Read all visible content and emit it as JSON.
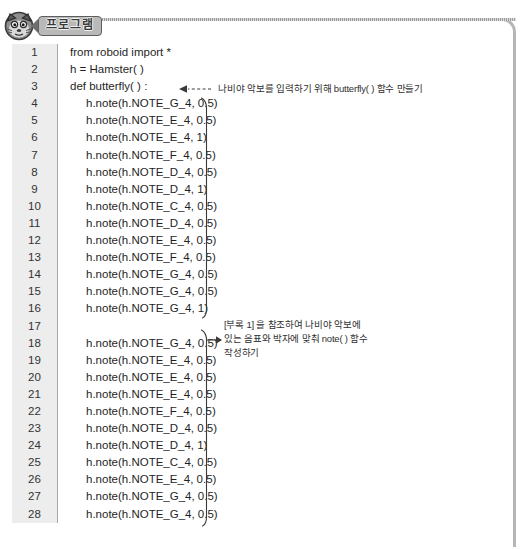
{
  "header": {
    "mascot_icon": "hamster-robot-icon",
    "tag_label": "프로그램",
    "tag_arrow_icon": "left-arrow-tip-icon"
  },
  "editor": {
    "lines": [
      {
        "n": "1",
        "text": "from roboid import *",
        "indent": false
      },
      {
        "n": "2",
        "text": "h = Hamster( )",
        "indent": false
      },
      {
        "n": "3",
        "text": "def butterfly( ) :",
        "indent": false
      },
      {
        "n": "4",
        "text": "h.note(h.NOTE_G_4, 0.5)",
        "indent": true
      },
      {
        "n": "5",
        "text": "h.note(h.NOTE_E_4, 0.5)",
        "indent": true
      },
      {
        "n": "6",
        "text": "h.note(h.NOTE_E_4, 1)",
        "indent": true
      },
      {
        "n": "7",
        "text": "h.note(h.NOTE_F_4, 0.5)",
        "indent": true
      },
      {
        "n": "8",
        "text": "h.note(h.NOTE_D_4, 0.5)",
        "indent": true
      },
      {
        "n": "9",
        "text": "h.note(h.NOTE_D_4, 1)",
        "indent": true
      },
      {
        "n": "10",
        "text": "h.note(h.NOTE_C_4, 0.5)",
        "indent": true
      },
      {
        "n": "11",
        "text": "h.note(h.NOTE_D_4, 0.5)",
        "indent": true
      },
      {
        "n": "12",
        "text": "h.note(h.NOTE_E_4, 0.5)",
        "indent": true
      },
      {
        "n": "13",
        "text": "h.note(h.NOTE_F_4, 0.5)",
        "indent": true
      },
      {
        "n": "14",
        "text": "h.note(h.NOTE_G_4, 0.5)",
        "indent": true
      },
      {
        "n": "15",
        "text": "h.note(h.NOTE_G_4, 0.5)",
        "indent": true
      },
      {
        "n": "16",
        "text": "h.note(h.NOTE_G_4, 1)",
        "indent": true
      },
      {
        "n": "17",
        "text": "",
        "indent": true
      },
      {
        "n": "18",
        "text": "h.note(h.NOTE_G_4, 0.5)",
        "indent": true
      },
      {
        "n": "19",
        "text": "h.note(h.NOTE_E_4, 0.5)",
        "indent": true
      },
      {
        "n": "20",
        "text": "h.note(h.NOTE_E_4, 0.5)",
        "indent": true
      },
      {
        "n": "21",
        "text": "h.note(h.NOTE_E_4, 0.5)",
        "indent": true
      },
      {
        "n": "22",
        "text": "h.note(h.NOTE_F_4, 0.5)",
        "indent": true
      },
      {
        "n": "23",
        "text": "h.note(h.NOTE_D_4, 0.5)",
        "indent": true
      },
      {
        "n": "24",
        "text": "h.note(h.NOTE_D_4, 1)",
        "indent": true
      },
      {
        "n": "25",
        "text": "h.note(h.NOTE_C_4, 0.5)",
        "indent": true
      },
      {
        "n": "26",
        "text": "h.note(h.NOTE_E_4, 0.5)",
        "indent": true
      },
      {
        "n": "27",
        "text": "h.note(h.NOTE_G_4, 0.5)",
        "indent": true
      },
      {
        "n": "28",
        "text": "h.note(h.NOTE_G_4, 0.5)",
        "indent": true
      }
    ]
  },
  "annotations": {
    "top": "나비야 악보를 입력하기 위해 butterfly( ) 함수 만들기",
    "side_line1": "[부록 1] 을 참조하여 나비야 악보에",
    "side_line2": "있는 음표와 박자에 맞춰 note( ) 함수",
    "side_line3": "작성하기"
  },
  "colors": {
    "gutter_bg": "#ededed",
    "gutter_border": "#a8a8a8",
    "frame": "#b6b6b6",
    "tag_bg": "#b9b9b9",
    "tag_border": "#5e5e5e",
    "code_text": "#1f1f1f",
    "annotation_text": "#2f2f2f"
  }
}
